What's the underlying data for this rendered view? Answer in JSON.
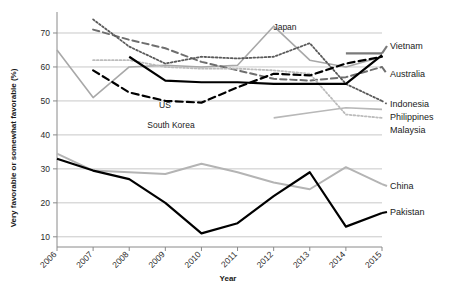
{
  "chart_data": {
    "type": "line",
    "title": "",
    "xlabel": "Year",
    "ylabel": "Very favorable or somewhat favorable (%)",
    "x": [
      2006,
      2007,
      2008,
      2009,
      2010,
      2011,
      2012,
      2013,
      2014,
      2015
    ],
    "xlim": [
      2006,
      2015
    ],
    "ylim": [
      7,
      75
    ],
    "yticks": [
      10,
      20,
      30,
      40,
      50,
      60,
      70
    ],
    "xticks": [
      "2006",
      "2007",
      "2008",
      "2009",
      "2010",
      "2011",
      "2012",
      "2013",
      "2014",
      "2015"
    ],
    "grid": "horizontal",
    "legend_position": "right-inline-labels",
    "series": [
      {
        "name": "Japan",
        "label": "Japan",
        "label_position": "inner-top",
        "style": "solid",
        "color": "#a8a8a8",
        "width": 1.6,
        "x": [
          2006,
          2007,
          2008,
          2009,
          2010,
          2011,
          2012,
          2013,
          2014,
          2015
        ],
        "values": [
          65,
          51,
          60,
          60.5,
          60,
          60.5,
          72,
          62,
          60,
          63
        ]
      },
      {
        "name": "Vietnam",
        "label": "Vietnam",
        "label_position": "right",
        "style": "solid",
        "color": "#7a7a7a",
        "width": 2.2,
        "x": [
          2014,
          2015
        ],
        "values": [
          64,
          64
        ]
      },
      {
        "name": "Australia",
        "label": "Australia",
        "label_position": "right",
        "style": "dashed",
        "color": "#6e6e6e",
        "width": 2.0,
        "x": [
          2007,
          2008,
          2009,
          2010,
          2011,
          2012,
          2013,
          2014,
          2015
        ],
        "values": [
          71,
          68,
          65.5,
          61.5,
          59,
          56.5,
          56,
          57,
          60
        ]
      },
      {
        "name": "Indonesia",
        "label": "Indonesia",
        "label_position": "right",
        "style": "dotted",
        "color": "#5a5a5a",
        "width": 1.8,
        "x": [
          2007,
          2008,
          2009,
          2010,
          2011,
          2012,
          2013,
          2014,
          2015
        ],
        "values": [
          74,
          66,
          61,
          63,
          62.5,
          63,
          67,
          55,
          50
        ]
      },
      {
        "name": "Philippines",
        "label": "Philippines",
        "label_position": "right",
        "style": "solid",
        "color": "#b8b8b8",
        "width": 1.6,
        "x": [
          2012,
          2013,
          2014,
          2015
        ],
        "values": [
          45,
          46.5,
          48,
          47.5
        ]
      },
      {
        "name": "Malaysia",
        "label": "Malaysia",
        "label_position": "right",
        "style": "dotted",
        "color": "#bcbcbc",
        "width": 1.8,
        "x": [
          2007,
          2008,
          2009,
          2010,
          2011,
          2012,
          2013,
          2014,
          2015
        ],
        "values": [
          62,
          62,
          60,
          59.5,
          59.5,
          59,
          58,
          46,
          45
        ]
      },
      {
        "name": "US",
        "label": "US",
        "label_position": "inner",
        "style": "solid",
        "color": "#000000",
        "width": 2.2,
        "x": [
          2008,
          2009,
          2010,
          2011,
          2012,
          2013,
          2014,
          2015
        ],
        "values": [
          63,
          56,
          55.5,
          55.5,
          55,
          55,
          55,
          63.5
        ]
      },
      {
        "name": "South Korea",
        "label": "South Korea",
        "label_position": "inner",
        "style": "dashed",
        "color": "#000000",
        "width": 2.2,
        "x": [
          2007,
          2008,
          2009,
          2010,
          2011,
          2012,
          2013,
          2014,
          2015
        ],
        "values": [
          59,
          52.5,
          50,
          49.5,
          54,
          58,
          57.5,
          61,
          63
        ]
      },
      {
        "name": "China",
        "label": "China",
        "label_position": "right",
        "style": "solid",
        "color": "#b4b4b4",
        "width": 2.0,
        "x": [
          2006,
          2007,
          2008,
          2009,
          2010,
          2011,
          2012,
          2013,
          2014,
          2015
        ],
        "values": [
          34.5,
          29.5,
          29,
          28.5,
          31.5,
          29,
          26,
          24,
          30.5,
          25.5
        ]
      },
      {
        "name": "Pakistan",
        "label": "Pakistan",
        "label_position": "right",
        "style": "solid",
        "color": "#000000",
        "width": 2.2,
        "x": [
          2006,
          2007,
          2008,
          2009,
          2010,
          2011,
          2012,
          2013,
          2014,
          2015
        ],
        "values": [
          33,
          29.5,
          27,
          20,
          11,
          14,
          22,
          29,
          13,
          17
        ]
      }
    ]
  },
  "labels": {
    "inner": [
      {
        "name": "us-annotation",
        "text": "US"
      },
      {
        "name": "south-korea-annotation",
        "text": "South Korea"
      },
      {
        "name": "japan-annotation",
        "text": "Japan"
      }
    ]
  },
  "colors": {
    "grid": "#c8c8c8",
    "axis": "#8a8a8a",
    "text": "#1a1a1a",
    "background": "#ffffff"
  }
}
